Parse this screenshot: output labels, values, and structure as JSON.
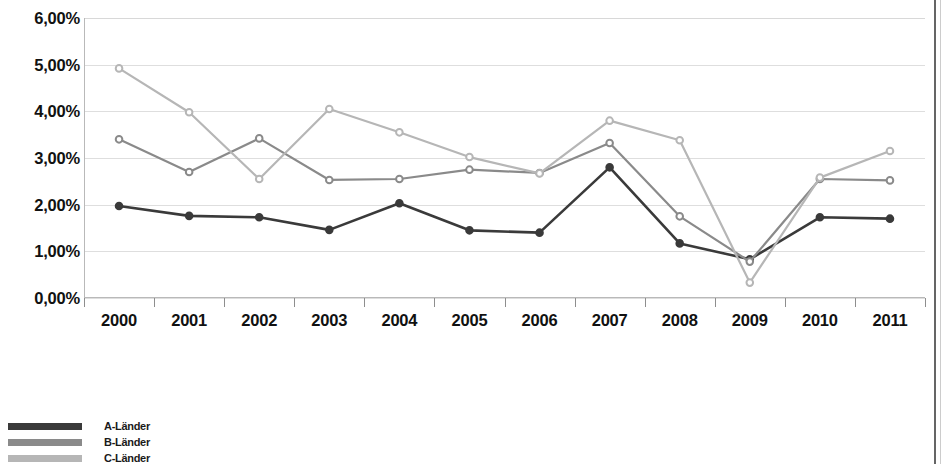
{
  "chart_data": {
    "type": "line",
    "title": "",
    "xlabel": "",
    "ylabel": "",
    "categories": [
      "2000",
      "2001",
      "2002",
      "2003",
      "2004",
      "2005",
      "2006",
      "2007",
      "2008",
      "2009",
      "2010",
      "2011"
    ],
    "ylim": [
      0,
      6
    ],
    "ytick_values": [
      6,
      5,
      4,
      3,
      2,
      1,
      0
    ],
    "ytick_labels": [
      "6,00%",
      "5,00%",
      "4,00%",
      "3,00%",
      "2,00%",
      "1,00%",
      "0,00%"
    ],
    "grid": true,
    "legend_position": "bottom-left",
    "series": [
      {
        "name": "A-Länder",
        "color": "#3a3a3a",
        "marker": "circle",
        "values": [
          1.97,
          1.76,
          1.73,
          1.46,
          2.03,
          1.45,
          1.4,
          2.8,
          1.17,
          0.83,
          1.73,
          1.7
        ]
      },
      {
        "name": "B-Länder",
        "color": "#8a8a8a",
        "marker": "circle",
        "values": [
          3.4,
          2.7,
          3.42,
          2.53,
          2.55,
          2.75,
          2.68,
          3.32,
          1.75,
          0.78,
          2.55,
          2.52
        ]
      },
      {
        "name": "C-Länder",
        "color": "#b6b6b6",
        "marker": "circle",
        "values": [
          4.92,
          3.98,
          2.55,
          4.05,
          3.55,
          3.02,
          2.67,
          3.8,
          3.38,
          0.33,
          2.58,
          3.15
        ]
      }
    ]
  },
  "legend": {
    "items": [
      {
        "label": "A-Länder",
        "color": "#3a3a3a"
      },
      {
        "label": "B-Länder",
        "color": "#8a8a8a"
      },
      {
        "label": "C-Länder",
        "color": "#b6b6b6"
      }
    ]
  },
  "colors": {
    "series_a": "#3a3a3a",
    "series_b": "#8a8a8a",
    "series_c": "#b6b6b6",
    "gridline": "#dedede",
    "axis": "#b9b9b9",
    "text": "#111111",
    "background": "#ffffff"
  }
}
